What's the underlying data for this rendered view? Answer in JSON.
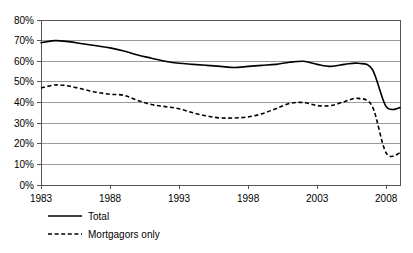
{
  "chart_data": {
    "type": "line",
    "title": "",
    "xlabel": "",
    "ylabel": "",
    "ylim": [
      0,
      80
    ],
    "xlim": [
      1983,
      2009
    ],
    "grid": true,
    "legend_position": "bottom-left",
    "y_ticks": [
      "0%",
      "10%",
      "20%",
      "30%",
      "40%",
      "50%",
      "60%",
      "70%",
      "80%"
    ],
    "y_tick_values": [
      0,
      10,
      20,
      30,
      40,
      50,
      60,
      70,
      80
    ],
    "x_ticks": [
      "1983",
      "1988",
      "1993",
      "1998",
      "2003",
      "2008"
    ],
    "x_tick_values": [
      1983,
      1988,
      1993,
      1998,
      2003,
      2008
    ],
    "x": [
      1983,
      1984,
      1985,
      1986,
      1987,
      1988,
      1989,
      1990,
      1991,
      1992,
      1993,
      1994,
      1995,
      1996,
      1997,
      1998,
      1999,
      2000,
      2001,
      2002,
      2003,
      2004,
      2005,
      2006,
      2007,
      2008,
      2009
    ],
    "series": [
      {
        "name": "Total",
        "style": "solid",
        "color": "#000000",
        "values": [
          69,
          70,
          69.5,
          68.5,
          67.5,
          66.5,
          65,
          63,
          61.5,
          60,
          59,
          58.5,
          58,
          57.5,
          57,
          57.5,
          58,
          58.5,
          59.5,
          60,
          58.5,
          57.5,
          58.5,
          59,
          56,
          38,
          37.5
        ]
      },
      {
        "name": "Mortgagors only",
        "style": "dashed",
        "color": "#000000",
        "values": [
          47,
          48.5,
          48,
          46.5,
          45,
          44,
          43.5,
          41,
          39,
          38,
          37,
          35,
          33.5,
          32.5,
          32.5,
          33,
          34.5,
          37,
          39.5,
          40,
          38.5,
          38.5,
          40.5,
          42,
          38,
          15.5,
          15.5
        ]
      }
    ]
  },
  "legend": {
    "items": [
      {
        "label": "Total",
        "style": "solid"
      },
      {
        "label": "Mortgagors only",
        "style": "dashed"
      }
    ]
  }
}
